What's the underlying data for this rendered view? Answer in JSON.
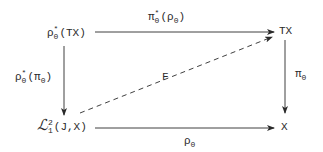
{
  "diagram": {
    "type": "commutative-diagram",
    "nodes": {
      "top_left": {
        "base": "ρ",
        "sub": "0",
        "sup": "*",
        "arg": "(TX)"
      },
      "top_right": {
        "label": "TX"
      },
      "bottom_left": {
        "base": "ℒ",
        "sub": "1",
        "sup": "2",
        "arg": "(J,X)"
      },
      "bottom_right": {
        "label": "X"
      }
    },
    "arrows": {
      "top": {
        "base": "π",
        "sub": "0",
        "sup": "*",
        "arg_base": "(ρ",
        "arg_sub": "0",
        "arg_close": ")",
        "from": "top_left",
        "to": "top_right"
      },
      "left": {
        "base": "ρ",
        "sub": "0",
        "sup": "*",
        "arg_base": "(π",
        "arg_sub": "0",
        "arg_close": ")",
        "from": "top_left",
        "to": "bottom_left"
      },
      "right": {
        "base": "π",
        "sub": "0",
        "from": "top_right",
        "to": "bottom_right"
      },
      "bottom": {
        "base": "ρ",
        "sub": "0",
        "from": "bottom_left",
        "to": "bottom_right"
      },
      "diagonal": {
        "label": "F",
        "style": "dashed",
        "from": "bottom_left",
        "to": "top_right"
      }
    },
    "colors": {
      "ink": "#2a2a2a",
      "background": "#ffffff"
    }
  }
}
